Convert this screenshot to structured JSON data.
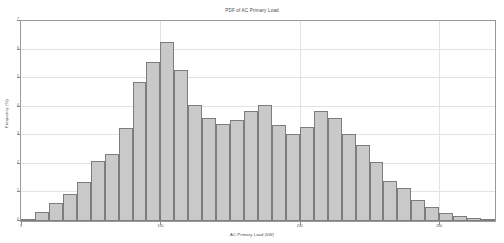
{
  "chart": {
    "title": "PDF of AC Primary Load",
    "xlabel": "AC Primary Load (kW)",
    "ylabel": "Frequency (%)"
  },
  "chart_data": {
    "type": "bar",
    "title": "PDF of AC Primary Load",
    "xlabel": "AC Primary Load (kW)",
    "ylabel": "Frequency (%)",
    "grid": true,
    "legend": null,
    "bin_width": 10,
    "xlim": [
      0,
      340
    ],
    "ylim": [
      0,
      7
    ],
    "xticks": [
      0,
      100,
      200,
      300
    ],
    "xticklabels": [
      "0",
      "100",
      "200",
      "300"
    ],
    "yticks": [
      0,
      1,
      2,
      3,
      4,
      5,
      6,
      7
    ],
    "yticklabels": [
      "0",
      "1",
      "2",
      "3",
      "4",
      "5",
      "6",
      "7"
    ],
    "categories": [
      "0",
      "10",
      "20",
      "30",
      "40",
      "50",
      "60",
      "70",
      "80",
      "90",
      "100",
      "110",
      "120",
      "130",
      "140",
      "150",
      "160",
      "170",
      "180",
      "190",
      "200",
      "210",
      "220",
      "230",
      "240",
      "250",
      "260",
      "270",
      "280",
      "290",
      "300",
      "310",
      "320",
      "330"
    ],
    "bin_centers": [
      5,
      15,
      25,
      35,
      45,
      55,
      65,
      75,
      85,
      95,
      105,
      115,
      125,
      135,
      145,
      155,
      165,
      175,
      185,
      195,
      205,
      215,
      225,
      235,
      245,
      255,
      265,
      275,
      285,
      295,
      305,
      315,
      325,
      335
    ],
    "values": [
      0.08,
      0.3,
      0.62,
      0.95,
      1.35,
      2.1,
      2.35,
      3.25,
      4.85,
      5.55,
      6.25,
      5.3,
      4.05,
      3.6,
      3.4,
      3.55,
      3.85,
      4.05,
      3.35,
      3.05,
      3.3,
      3.85,
      3.6,
      3.05,
      2.65,
      2.05,
      1.4,
      1.15,
      0.75,
      0.48,
      0.28,
      0.18,
      0.1,
      0.05
    ],
    "colors": {
      "bar_fill": "#c9c9c9",
      "bar_edge": "#7d7d7d",
      "grid": "#e2e2e2",
      "frame": "#9a9a9a",
      "text": "#4a4a4a",
      "background": "#ffffff"
    }
  }
}
